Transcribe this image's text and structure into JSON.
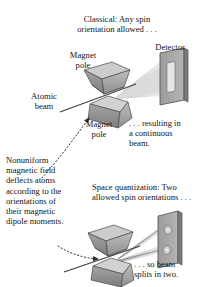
{
  "figure": {
    "title_semantic": "stern-gerlach-experiment-diagram",
    "background_color": "#ffffff",
    "ink_color": "#141414"
  },
  "labels": {
    "classical_note": "Classical:  Any spin\norientation allowed . . .",
    "detector_top": "Detector",
    "magnet_pole_top": "Magnet\npole",
    "atomic_beam": "Atomic\nbeam",
    "magnet_pole_bottom": "Magnet\npole",
    "continuous_result": ". . . resulting in\na continuous\nbeam.",
    "nonuniform_paragraph": "Nonuniform\nmagnetic field\ndeflects atoms\naccording to the\norientations of\ntheir magnetic\ndipole moments.",
    "space_quantization": "Space quantization:  Two\nallowed spin orientations . . .",
    "split_result": ". . . so beam\nsplits in two."
  },
  "diagrams": {
    "top": {
      "name": "classical-prediction-diagram",
      "magnet_upper_face": "#a9a9a9",
      "magnet_lower_face": "#8c8c8c",
      "magnet_top_face": "#c9c9c9",
      "detector_screen_color": "#9a9a9a",
      "detector_screen_edge": "#6e6e6e",
      "beam_stripe_color": "#e2e2e2",
      "beam_count": 1,
      "beam_pattern": "continuous-vertical-stripe"
    },
    "bottom": {
      "name": "space-quantization-diagram",
      "magnet_upper_face": "#a9a9a9",
      "magnet_lower_face": "#8c8c8c",
      "magnet_top_face": "#c9c9c9",
      "detector_screen_color": "#9a9a9a",
      "detector_screen_edge": "#6e6e6e",
      "beam_stripe_color": "#e2e2e2",
      "beam_count": 2,
      "beam_pattern": "two-discrete-spots"
    }
  },
  "annotations": {
    "pointer_top": "dotted-curved-arrow-to-upper-magnet-gap",
    "pointer_bottom": "dotted-curved-arrow-to-lower-magnet-gap"
  }
}
